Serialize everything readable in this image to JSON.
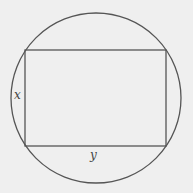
{
  "diagram": {
    "type": "rectangle inscribed in circle",
    "circle": {
      "cx": 96,
      "cy": 98,
      "r": 85,
      "stroke": "#555555"
    },
    "rectangle": {
      "x": 25,
      "y": 50,
      "width": 141,
      "height": 96,
      "stroke": "#555555"
    },
    "labels": {
      "side_height": "x",
      "side_width": "y"
    },
    "background": "#efefef"
  }
}
